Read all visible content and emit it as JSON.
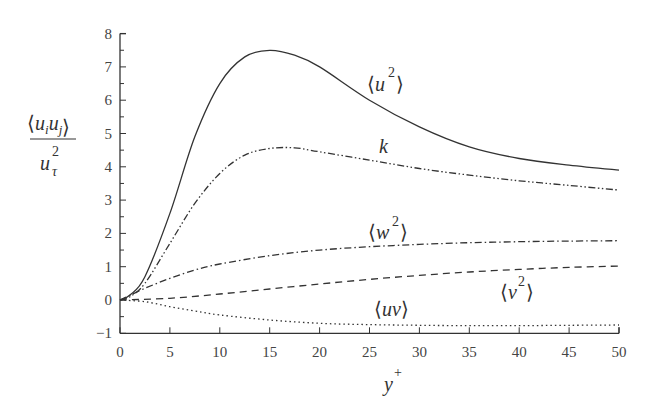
{
  "chart_data": {
    "type": "line",
    "title": "",
    "xlabel": "y+",
    "ylabel": "<u_i u_j> / u_tau^2",
    "xlim": [
      0,
      50
    ],
    "ylim": [
      -1,
      8
    ],
    "xticks": [
      0,
      5,
      10,
      15,
      20,
      25,
      30,
      35,
      40,
      45,
      50
    ],
    "yticks": [
      -1,
      0,
      1,
      2,
      3,
      4,
      5,
      6,
      7,
      8
    ],
    "grid": false,
    "legend": "inline curve labels",
    "series": [
      {
        "name": "<u^2>",
        "style": "solid",
        "x": [
          0,
          1,
          2.5,
          5,
          7.5,
          10,
          12.5,
          15,
          17.5,
          20,
          25,
          30,
          35,
          40,
          45,
          50
        ],
        "values": [
          0,
          0.15,
          0.7,
          2.6,
          4.9,
          6.5,
          7.3,
          7.5,
          7.35,
          7.0,
          6.0,
          5.2,
          4.6,
          4.25,
          4.05,
          3.9
        ]
      },
      {
        "name": "k",
        "style": "dash-dot-dot",
        "x": [
          0,
          1,
          2.5,
          5,
          7.5,
          10,
          12.5,
          15,
          17.5,
          20,
          25,
          30,
          35,
          40,
          45,
          50
        ],
        "values": [
          0,
          0.1,
          0.5,
          1.7,
          2.9,
          3.8,
          4.35,
          4.55,
          4.57,
          4.45,
          4.2,
          3.95,
          3.75,
          3.58,
          3.44,
          3.3
        ]
      },
      {
        "name": "<w^2>",
        "style": "dash-dot",
        "x": [
          0,
          2.5,
          5,
          7.5,
          10,
          15,
          20,
          25,
          30,
          35,
          40,
          45,
          50
        ],
        "values": [
          0,
          0.35,
          0.65,
          0.9,
          1.08,
          1.33,
          1.5,
          1.6,
          1.67,
          1.72,
          1.75,
          1.77,
          1.78
        ]
      },
      {
        "name": "<v^2>",
        "style": "dashed",
        "x": [
          0,
          5,
          10,
          15,
          20,
          25,
          30,
          35,
          40,
          45,
          50
        ],
        "values": [
          0,
          0.05,
          0.18,
          0.33,
          0.48,
          0.62,
          0.74,
          0.84,
          0.92,
          0.98,
          1.02
        ]
      },
      {
        "name": "<uv>",
        "style": "dotted",
        "x": [
          0,
          2.5,
          5,
          7.5,
          10,
          15,
          20,
          25,
          30,
          35,
          40,
          45,
          50
        ],
        "values": [
          0,
          -0.05,
          -0.2,
          -0.33,
          -0.45,
          -0.6,
          -0.7,
          -0.74,
          -0.76,
          -0.77,
          -0.77,
          -0.76,
          -0.75
        ]
      }
    ],
    "annotations": [
      {
        "text": "<u^2>",
        "x": 29,
        "y": 6.1
      },
      {
        "text": "k",
        "x": 27,
        "y": 4.4
      },
      {
        "text": "<w^2>",
        "x": 26.5,
        "y": 2.0
      },
      {
        "text": "<v^2>",
        "x": 38,
        "y": 0.1
      },
      {
        "text": "<uv>",
        "x": 27,
        "y": -0.55
      }
    ]
  },
  "labels": {
    "u2_base": "u",
    "u2_sup": "2",
    "k": "k",
    "w2_base": "w",
    "w2_sup": "2",
    "v2_base": "v",
    "v2_sup": "2",
    "uv": "uv",
    "xlabel_base": "y",
    "xlabel_sup": "+",
    "ylabel_num_u1": "u",
    "ylabel_num_i": "i",
    "ylabel_num_u2": "u",
    "ylabel_num_j": "j",
    "ylabel_den_u": "u",
    "ylabel_den_sup": "2",
    "ylabel_den_sub": "τ",
    "lang": "⟨",
    "rang": "⟩"
  }
}
